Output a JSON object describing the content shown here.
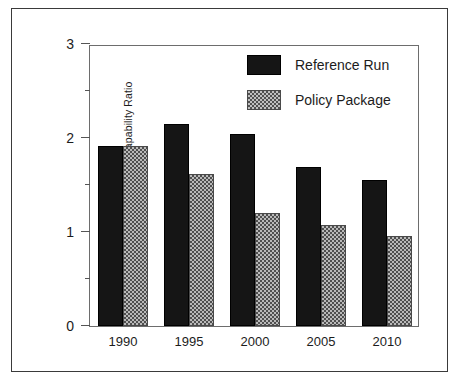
{
  "chart_data": {
    "type": "bar",
    "title": "",
    "xlabel": "",
    "ylabel": "USSR to China Capability Ratio",
    "categories": [
      "1990",
      "1995",
      "2000",
      "2005",
      "2010"
    ],
    "series": [
      {
        "name": "Reference Run",
        "color": "#151515",
        "pattern": "solid",
        "values": [
          1.92,
          2.15,
          2.04,
          1.69,
          1.55
        ]
      },
      {
        "name": "Policy Package",
        "color": "#b9b9b9",
        "pattern": "checkerboard",
        "values": [
          1.92,
          1.62,
          1.2,
          1.07,
          0.96
        ]
      }
    ],
    "ylim": [
      0,
      3
    ],
    "ytick_labels": [
      "0",
      "1",
      "2",
      "3"
    ],
    "ytick_values": [
      0,
      1,
      2,
      3
    ],
    "yminor_values": [
      0.5,
      1.5,
      2.5
    ],
    "grid": false,
    "legend_position": "top-right"
  },
  "legend": {
    "entries": [
      {
        "label": "Reference Run"
      },
      {
        "label": "Policy Package"
      }
    ]
  }
}
